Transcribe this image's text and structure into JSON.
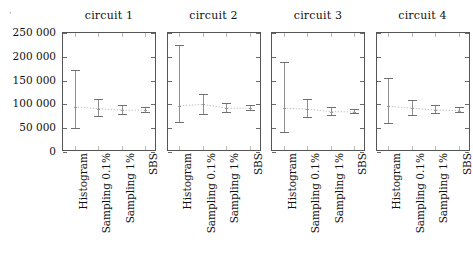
{
  "figure": {
    "stray_mark": "’",
    "background_color": "#ffffff"
  },
  "axis": {
    "y_tick_labels": [
      "250 000",
      "200 000",
      "150 000",
      "100 000",
      "50 000",
      "0"
    ],
    "y_tick_values": [
      250000,
      200000,
      150000,
      100000,
      50000,
      0
    ],
    "x_tick_labels": [
      "Histogram",
      "Sampling 0.1%",
      "Sampling 1%",
      "SBS"
    ]
  },
  "style": {
    "frame_color": "#555555",
    "errorbar_color": "#8e8e8e",
    "cap_color": "#6f6f6f",
    "connector_color": "#c4c4c4",
    "tick_color": "#6b6b6b"
  },
  "chart_data": {
    "type": "errorbar",
    "title": "",
    "subtitle": "",
    "xlabel": "",
    "ylabel": "",
    "ylim": [
      0,
      250000
    ],
    "ytick_values": [
      0,
      50000,
      100000,
      150000,
      200000,
      250000
    ],
    "ytick_labels": [
      "0",
      "50 000",
      "100 000",
      "150 000",
      "200 000",
      "250 000"
    ],
    "grid": false,
    "legend_position": "none",
    "shared_y_axis": true,
    "categories": [
      "Histogram",
      "Sampling 0.1%",
      "Sampling 1%",
      "SBS"
    ],
    "panels": [
      {
        "title": "circuit 1",
        "values": [
          95000,
          91000,
          88000,
          88000
        ],
        "lower": [
          48000,
          73000,
          77000,
          82000
        ],
        "upper": [
          172000,
          112000,
          99000,
          95000
        ]
      },
      {
        "title": "circuit 2",
        "values": [
          97000,
          100000,
          92000,
          92000
        ],
        "lower": [
          60000,
          78000,
          82000,
          86000
        ],
        "upper": [
          225000,
          122000,
          103000,
          99000
        ]
      },
      {
        "title": "circuit 3",
        "values": [
          92000,
          90000,
          85000,
          84000
        ],
        "lower": [
          40000,
          72000,
          76000,
          79000
        ],
        "upper": [
          190000,
          112000,
          95000,
          91000
        ]
      },
      {
        "title": "circuit 4",
        "values": [
          96000,
          92000,
          88000,
          87000
        ],
        "lower": [
          58000,
          76000,
          79000,
          82000
        ],
        "upper": [
          155000,
          110000,
          98000,
          94000
        ]
      }
    ]
  }
}
